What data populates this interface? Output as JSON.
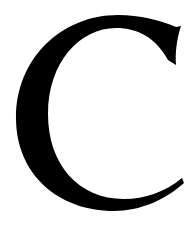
{
  "glyph": {
    "character": "C",
    "color": "#000000",
    "background": "#ffffff"
  }
}
